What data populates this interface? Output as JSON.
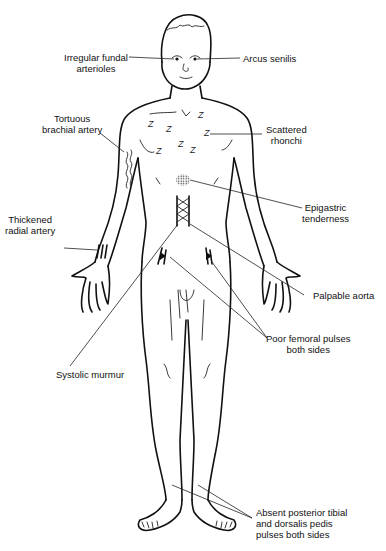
{
  "figure": {
    "ink_color": "#111111",
    "background_color": "#ffffff",
    "symbols": {
      "rhonchi": "Z",
      "rhonchi_count": 7
    },
    "labels": {
      "fundal": [
        "Irregular fundal",
        "arterioles"
      ],
      "arcus": [
        "Arcus senilis"
      ],
      "brachial": [
        "Tortuous",
        "brachial artery"
      ],
      "rhonchi": [
        "Scattered",
        "rhonchi"
      ],
      "epigastric": [
        "Epigastric",
        "tenderness"
      ],
      "radial": [
        "Thickened",
        "radial artery"
      ],
      "aorta": [
        "Palpable aorta"
      ],
      "femoral": [
        "Poor femoral pulses",
        "both sides"
      ],
      "murmur": [
        "Systolic murmur"
      ],
      "pedal": [
        "Absent posterior tibial",
        "and dorsalis pedis",
        "pulses both sides"
      ]
    }
  }
}
